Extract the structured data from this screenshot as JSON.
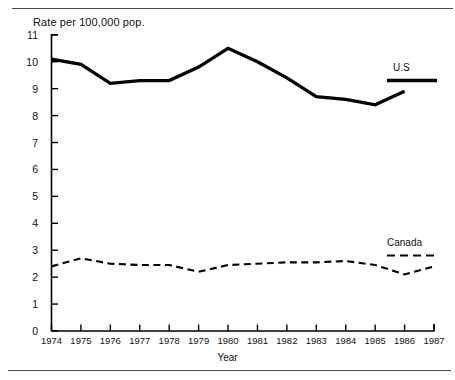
{
  "figure": {
    "title": "Rate per 100,000 pop.",
    "xlabel": "Year"
  },
  "legend": {
    "us_label": "U.S",
    "canada_label": "Canada"
  },
  "chart_data": {
    "type": "line",
    "title": "Rate per 100,000 pop.",
    "xlabel": "Year",
    "ylabel": "Rate per 100,000 pop.",
    "x": [
      1974,
      1975,
      1976,
      1977,
      1978,
      1979,
      1980,
      1981,
      1982,
      1983,
      1984,
      1985,
      1986,
      1987
    ],
    "xtick_labels": [
      "1974",
      "1975",
      "1976",
      "1977",
      "1978",
      "1979",
      "1980",
      "1981",
      "1982",
      "1983",
      "1984",
      "1985",
      "1986",
      "1987"
    ],
    "ytick_labels": [
      "0",
      "1",
      "2",
      "3",
      "4",
      "5",
      "6",
      "7",
      "8",
      "9",
      "10",
      "11"
    ],
    "ylim": [
      0,
      11
    ],
    "xlim": [
      1974,
      1987
    ],
    "grid": false,
    "legend_position": "right",
    "series": [
      {
        "name": "U.S",
        "style": "solid",
        "color": "#000000",
        "x": [
          1974,
          1975,
          1976,
          1977,
          1978,
          1979,
          1980,
          1981,
          1982,
          1983,
          1984,
          1985,
          1986
        ],
        "values": [
          10.1,
          9.9,
          9.2,
          9.3,
          9.3,
          9.8,
          10.5,
          10.0,
          9.4,
          8.7,
          8.6,
          8.4,
          8.9
        ]
      },
      {
        "name": "Canada",
        "style": "dashed",
        "color": "#000000",
        "x": [
          1974,
          1975,
          1976,
          1977,
          1978,
          1979,
          1980,
          1981,
          1982,
          1983,
          1984,
          1985,
          1986,
          1987
        ],
        "values": [
          2.4,
          2.7,
          2.5,
          2.45,
          2.45,
          2.2,
          2.45,
          2.5,
          2.55,
          2.55,
          2.6,
          2.45,
          2.1,
          2.4
        ]
      }
    ]
  }
}
